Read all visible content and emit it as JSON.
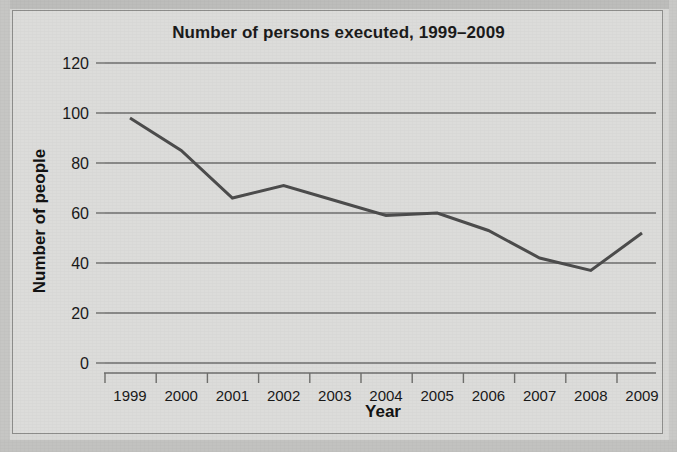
{
  "chart_data": {
    "type": "line",
    "title": "Number of persons executed, 1999–2009",
    "xlabel": "Year",
    "ylabel": "Number of people",
    "categories": [
      "1999",
      "2000",
      "2001",
      "2002",
      "2003",
      "2004",
      "2005",
      "2006",
      "2007",
      "2008",
      "2009"
    ],
    "values": [
      98,
      85,
      66,
      71,
      65,
      59,
      60,
      53,
      42,
      37,
      52
    ],
    "series": [
      {
        "name": "Number of persons executed",
        "values": [
          98,
          85,
          66,
          71,
          65,
          59,
          60,
          53,
          42,
          37,
          52
        ]
      }
    ],
    "x": [
      1999,
      2000,
      2001,
      2002,
      2003,
      2004,
      2005,
      2006,
      2007,
      2008,
      2009
    ],
    "ylim": [
      0,
      120
    ],
    "yticks": [
      "0",
      "20",
      "40",
      "60",
      "80",
      "100",
      "120"
    ],
    "ytick_values": [
      0,
      20,
      40,
      60,
      80,
      100,
      120
    ],
    "xticks": [
      "1999",
      "2000",
      "2001",
      "2002",
      "2003",
      "2004",
      "2005",
      "2006",
      "2007",
      "2008",
      "2009"
    ],
    "grid": "horizontal",
    "legend": "none",
    "line_color": "#4c4c4c",
    "grid_color": "#6e6e6c",
    "background_color": "#dcdcda",
    "text_color": "#191919"
  }
}
